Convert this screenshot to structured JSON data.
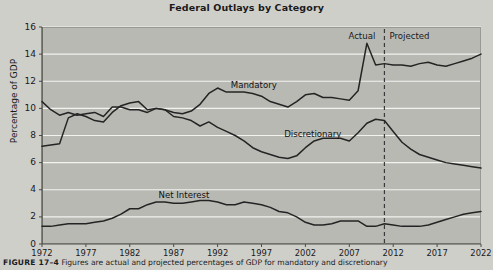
{
  "figure": {
    "title": "Federal Outlays by Category",
    "caption_label": "FIGURE 17–4",
    "caption_text": "Figures are actual and projected percentages of GDP for mandatory and discretionary"
  },
  "axes": {
    "ylabel": "Percentage of GDP",
    "yticks": [
      "0",
      "2",
      "4",
      "6",
      "8",
      "10",
      "12",
      "14",
      "16"
    ],
    "ylim": [
      0,
      16
    ],
    "xticks": [
      "1972",
      "1977",
      "1982",
      "1987",
      "1992",
      "1997",
      "2002",
      "2007",
      "2012",
      "2017",
      "2022"
    ],
    "xlim": [
      1972,
      2022
    ],
    "grid": "horizontal"
  },
  "annotations": {
    "actual": "Actual",
    "projected": "Projected",
    "divider_year": 2011
  },
  "colors": {
    "plot_background": "#b9b9b4",
    "page_background": "#cfcfca",
    "line": "#242424",
    "gridline": "#f2f2ee",
    "divider": "#3a3a3a"
  },
  "chart_data": {
    "type": "line",
    "title": "Federal Outlays by Category",
    "xlabel": "",
    "ylabel": "Percentage of GDP",
    "xlim": [
      1972,
      2022
    ],
    "ylim": [
      0,
      16
    ],
    "grid": true,
    "legend": "inline-labels",
    "x": [
      1972,
      1973,
      1974,
      1975,
      1976,
      1977,
      1978,
      1979,
      1980,
      1981,
      1982,
      1983,
      1984,
      1985,
      1986,
      1987,
      1988,
      1989,
      1990,
      1991,
      1992,
      1993,
      1994,
      1995,
      1996,
      1997,
      1998,
      1999,
      2000,
      2001,
      2002,
      2003,
      2004,
      2005,
      2006,
      2007,
      2008,
      2009,
      2010,
      2011,
      2012,
      2013,
      2014,
      2015,
      2016,
      2017,
      2018,
      2019,
      2020,
      2021,
      2022
    ],
    "series": [
      {
        "name": "Mandatory",
        "label_x": 1996,
        "values": [
          7.2,
          7.3,
          7.4,
          9.3,
          9.6,
          9.4,
          9.1,
          9.0,
          9.7,
          10.2,
          10.4,
          10.5,
          9.9,
          10.0,
          9.9,
          9.7,
          9.6,
          9.8,
          10.3,
          11.1,
          11.5,
          11.2,
          11.2,
          11.2,
          11.1,
          10.9,
          10.5,
          10.3,
          10.1,
          10.5,
          11.0,
          11.1,
          10.8,
          10.8,
          10.7,
          10.6,
          11.3,
          14.8,
          13.2,
          13.3,
          13.2,
          13.2,
          13.1,
          13.3,
          13.4,
          13.2,
          13.1,
          13.3,
          13.5,
          13.7,
          14.0
        ]
      },
      {
        "name": "Discretionary",
        "label_x": 2003,
        "values": [
          10.5,
          9.9,
          9.5,
          9.7,
          9.5,
          9.6,
          9.7,
          9.4,
          10.1,
          10.1,
          9.9,
          9.9,
          9.7,
          10.0,
          9.9,
          9.4,
          9.3,
          9.1,
          8.7,
          9.0,
          8.6,
          8.3,
          8.0,
          7.6,
          7.1,
          6.8,
          6.6,
          6.4,
          6.3,
          6.5,
          7.1,
          7.6,
          7.8,
          7.8,
          7.8,
          7.6,
          8.2,
          8.9,
          9.2,
          9.1,
          8.3,
          7.5,
          7.0,
          6.6,
          6.4,
          6.2,
          6.0,
          5.9,
          5.8,
          5.7,
          5.6
        ]
      },
      {
        "name": "Net Interest",
        "label_x": 1988,
        "values": [
          1.3,
          1.3,
          1.4,
          1.5,
          1.5,
          1.5,
          1.6,
          1.7,
          1.9,
          2.2,
          2.6,
          2.6,
          2.9,
          3.1,
          3.1,
          3.0,
          3.0,
          3.1,
          3.2,
          3.2,
          3.1,
          2.9,
          2.9,
          3.1,
          3.0,
          2.9,
          2.7,
          2.4,
          2.3,
          2.0,
          1.6,
          1.4,
          1.4,
          1.5,
          1.7,
          1.7,
          1.7,
          1.3,
          1.3,
          1.5,
          1.4,
          1.3,
          1.3,
          1.3,
          1.4,
          1.6,
          1.8,
          2.0,
          2.2,
          2.3,
          2.4
        ]
      }
    ]
  }
}
